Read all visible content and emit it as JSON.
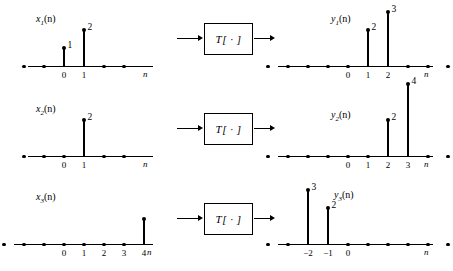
{
  "figure": {
    "operator_label": "T[ · ]",
    "axis_name": "n",
    "sample_spacing_px": 20,
    "colors": {
      "ink": "#000000",
      "background": "#ffffff"
    }
  },
  "rows": [
    {
      "input": {
        "name_base": "x",
        "name_sub": "1",
        "name_paren": "(n)",
        "label_left_px": 36,
        "label_top_px": 14,
        "axis_left_px": 28,
        "axis_width_px": 125,
        "axis_y_px": 66,
        "origin_px": 64,
        "axis_name_left_px": 143,
        "axis_name_top_px": 70,
        "zero_samples": [
          -2,
          -1,
          2,
          3
        ],
        "stems": [
          {
            "n": 0,
            "value": 1,
            "value_text": "1"
          },
          {
            "n": 1,
            "value": 2,
            "value_text": "2"
          }
        ],
        "ticks": [
          {
            "n": 0,
            "text": "0"
          },
          {
            "n": 1,
            "text": "1"
          }
        ]
      },
      "output": {
        "name_base": "y",
        "name_sub": "1",
        "name_paren": "(n)",
        "label_left_px": 53,
        "label_top_px": 14,
        "axis_left_px": 0,
        "axis_width_px": 155,
        "axis_y_px": 66,
        "origin_px": 70,
        "axis_name_left_px": 146,
        "axis_name_top_px": 70,
        "zero_samples": [
          -4,
          -3,
          -2,
          -1,
          0,
          3,
          4,
          5
        ],
        "stems": [
          {
            "n": 1,
            "value": 2,
            "value_text": "2"
          },
          {
            "n": 2,
            "value": 3,
            "value_text": "3"
          }
        ],
        "ticks": [
          {
            "n": 0,
            "text": "0"
          },
          {
            "n": 1,
            "text": "1"
          },
          {
            "n": 2,
            "text": "2"
          }
        ]
      }
    },
    {
      "input": {
        "name_base": "x",
        "name_sub": "2",
        "name_paren": "(n)",
        "label_left_px": 36,
        "label_top_px": 14,
        "axis_left_px": 28,
        "axis_width_px": 125,
        "axis_y_px": 66,
        "origin_px": 64,
        "axis_name_left_px": 143,
        "axis_name_top_px": 70,
        "zero_samples": [
          -2,
          -1,
          0,
          2,
          3
        ],
        "stems": [
          {
            "n": 1,
            "value": 2,
            "value_text": "2"
          }
        ],
        "ticks": [
          {
            "n": 0,
            "text": "0"
          },
          {
            "n": 1,
            "text": "1"
          }
        ]
      },
      "output": {
        "name_base": "y",
        "name_sub": "2",
        "name_paren": "(n)",
        "label_left_px": 53,
        "label_top_px": 20,
        "axis_left_px": 0,
        "axis_width_px": 155,
        "axis_y_px": 66,
        "origin_px": 70,
        "axis_name_left_px": 146,
        "axis_name_top_px": 70,
        "zero_samples": [
          -4,
          -3,
          -2,
          -1,
          0,
          1,
          4,
          5
        ],
        "stems": [
          {
            "n": 2,
            "value": 2,
            "value_text": "2"
          },
          {
            "n": 3,
            "value": 4,
            "value_text": "4"
          }
        ],
        "ticks": [
          {
            "n": 0,
            "text": "0"
          },
          {
            "n": 1,
            "text": "1"
          },
          {
            "n": 2,
            "text": "2"
          },
          {
            "n": 3,
            "text": "3"
          }
        ]
      }
    },
    {
      "input": {
        "name_base": "x",
        "name_sub": "3",
        "name_paren": "(n)",
        "label_left_px": 36,
        "label_top_px": 12,
        "axis_left_px": 14,
        "axis_width_px": 139,
        "axis_y_px": 64,
        "origin_px": 64,
        "axis_name_left_px": 147,
        "axis_name_top_px": 68,
        "zero_samples": [
          -4,
          -3,
          -2,
          -1,
          0,
          1,
          2,
          3
        ],
        "stems": [
          {
            "n": 4,
            "value": 1.4,
            "value_text": ""
          }
        ],
        "ticks": [
          {
            "n": 0,
            "text": "0"
          },
          {
            "n": 1,
            "text": "1"
          },
          {
            "n": 2,
            "text": "2"
          },
          {
            "n": 3,
            "text": "3"
          },
          {
            "n": 4,
            "text": "4"
          }
        ]
      },
      "output": {
        "name_base": "y",
        "name_sub": "3",
        "name_paren": "(n)",
        "label_left_px": 56,
        "label_top_px": 10,
        "axis_left_px": 0,
        "axis_width_px": 155,
        "axis_y_px": 64,
        "origin_px": 70,
        "axis_name_left_px": 146,
        "axis_name_top_px": 68,
        "zero_samples": [
          -4,
          -3,
          0,
          1,
          2,
          3,
          4,
          5
        ],
        "stems": [
          {
            "n": -2,
            "value": 3,
            "value_text": "3"
          },
          {
            "n": -1,
            "value": 2,
            "value_text": "2"
          }
        ],
        "ticks": [
          {
            "n": -2,
            "text": "−2"
          },
          {
            "n": -1,
            "text": "−1"
          },
          {
            "n": 0,
            "text": "0"
          }
        ]
      }
    }
  ]
}
